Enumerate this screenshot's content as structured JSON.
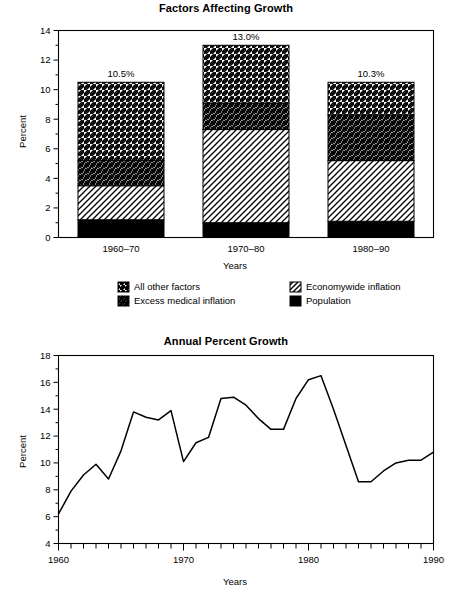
{
  "page": {
    "background": "#ffffff",
    "ink": "#000000"
  },
  "figures": [
    {
      "id": "factors-affecting-growth",
      "title": "Factors Affecting Growth"
    },
    {
      "id": "annual-percent-growth",
      "title": "Annual Percent Growth"
    }
  ],
  "chart_data": [
    {
      "type": "bar",
      "subtype": "stacked",
      "title": "Factors Affecting Growth",
      "xlabel": "Years",
      "ylabel": "Percent",
      "ylim": [
        0,
        14
      ],
      "yticks": [
        0,
        2,
        4,
        6,
        8,
        10,
        12,
        14
      ],
      "yticklabels": [
        "0",
        "2",
        "4",
        "6",
        "8",
        "10",
        "12",
        "14"
      ],
      "yminorticks": [
        1,
        3,
        5,
        7,
        9,
        11,
        13
      ],
      "grid": false,
      "legend_position": "below",
      "categories": [
        "1960–70",
        "1970–80",
        "1980–90"
      ],
      "totals_labels": [
        "10.5%",
        "13.0%",
        "10.3%"
      ],
      "series": [
        {
          "name": "Population",
          "pattern": "solid-black",
          "color": "#000000",
          "values": [
            1.2,
            1.0,
            1.1
          ]
        },
        {
          "name": "Economywide inflation",
          "pattern": "backward-diagonal",
          "color": "#ffffff",
          "values": [
            2.3,
            6.3,
            4.1
          ]
        },
        {
          "name": "Excess medical inflation",
          "pattern": "cross-hatch",
          "color": "#ffffff",
          "values": [
            1.7,
            1.8,
            3.1
          ]
        },
        {
          "name": "All other factors",
          "pattern": "forward-diagonal",
          "color": "#ffffff",
          "values": [
            5.3,
            3.9,
            2.2
          ]
        }
      ],
      "cumulative_tops": [
        [
          1.2,
          3.5,
          5.2,
          10.5
        ],
        [
          1.0,
          7.3,
          9.1,
          13.0
        ],
        [
          1.1,
          5.2,
          8.3,
          10.5
        ]
      ],
      "legend": [
        {
          "label": "All other factors",
          "pattern": "forward-diagonal"
        },
        {
          "label": "Economywide inflation",
          "pattern": "backward-diagonal"
        },
        {
          "label": "Excess medical inflation",
          "pattern": "cross-hatch"
        },
        {
          "label": "Population",
          "pattern": "solid-black"
        }
      ]
    },
    {
      "type": "line",
      "title": "Annual Percent Growth",
      "xlabel": "Years",
      "ylabel": "Percent",
      "xlim": [
        1960,
        1990
      ],
      "ylim": [
        4,
        18
      ],
      "yticks": [
        4,
        6,
        8,
        10,
        12,
        14,
        16,
        18
      ],
      "yticklabels": [
        "4",
        "6",
        "8",
        "10",
        "12",
        "14",
        "16",
        "18"
      ],
      "yminorticks": [
        5,
        7,
        9,
        11,
        13,
        15,
        17
      ],
      "xticks": [
        1960,
        1970,
        1980,
        1990
      ],
      "xticklabels": [
        "1960",
        "1970",
        "1980",
        "1990"
      ],
      "xminortick_step": 1,
      "grid": false,
      "legend_position": "none",
      "x": [
        1960,
        1961,
        1962,
        1963,
        1964,
        1965,
        1966,
        1967,
        1968,
        1969,
        1970,
        1971,
        1972,
        1973,
        1974,
        1975,
        1976,
        1977,
        1978,
        1979,
        1980,
        1981,
        1982,
        1983,
        1984,
        1985,
        1986,
        1987,
        1988,
        1989,
        1990
      ],
      "y": [
        6.2,
        7.9,
        9.1,
        9.9,
        8.8,
        10.9,
        13.8,
        13.4,
        13.2,
        13.9,
        10.1,
        11.5,
        11.9,
        14.8,
        14.9,
        14.3,
        13.3,
        12.5,
        12.5,
        14.8,
        16.2,
        16.5,
        14.0,
        11.3,
        8.6,
        8.6,
        9.4,
        10.0,
        10.2,
        10.2,
        10.8
      ]
    }
  ]
}
